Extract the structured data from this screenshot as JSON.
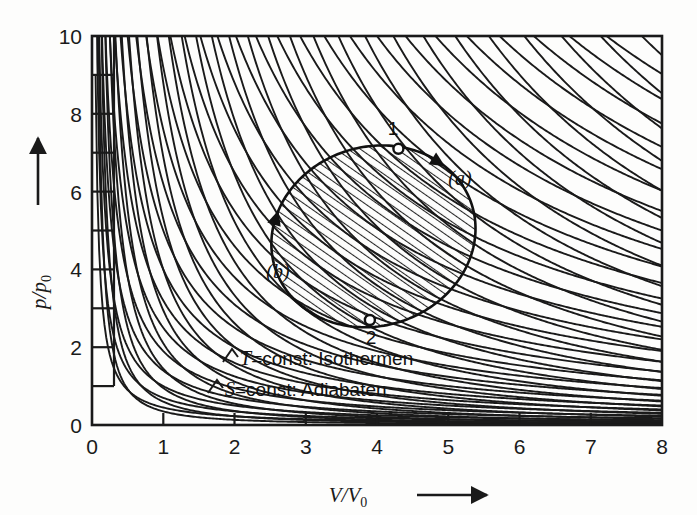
{
  "figure": {
    "name": "p-V diagram with isotherms and adiabats",
    "background_color": "#fdfdfc",
    "ink_color": "#1a1a1a"
  },
  "chart_data": {
    "type": "line",
    "title": "",
    "xlabel": "V/V0",
    "ylabel": "p/p0",
    "xlabel_display": "V/V",
    "xlabel_sub": "0",
    "ylabel_display": "p/p",
    "ylabel_sub": "0",
    "xlim": [
      0,
      8
    ],
    "ylim": [
      0,
      10
    ],
    "grid": false,
    "x_ticks_major": [
      0,
      1,
      2,
      3,
      4,
      5,
      6,
      7,
      8
    ],
    "x_tick_labels": [
      "0",
      "1",
      "2",
      "3",
      "4",
      "5",
      "6",
      "7",
      "8"
    ],
    "y_ticks_major": [
      0,
      2,
      4,
      6,
      8,
      10
    ],
    "y_tick_labels": [
      "0",
      "2",
      "4",
      "6",
      "8",
      "10"
    ],
    "y_ticks_minor": [
      1,
      3,
      5,
      7,
      9
    ],
    "x_arrow": true,
    "y_arrow": true,
    "series": [
      {
        "name": "Isothermen",
        "family": "isotherm",
        "law": "p*V = c",
        "exponent": 1.0,
        "legend_label": "T=const: Isothermen",
        "legend_symbol": "T",
        "legend_rest": "=const: Isothermen",
        "constants": [
          0.45,
          0.7,
          1.0,
          1.4,
          1.9,
          2.5,
          3.2,
          4.0,
          5.0,
          6.2,
          7.6,
          9.2,
          11.0,
          13.0,
          15.2,
          17.6,
          20.2,
          23.0,
          26.0,
          29.2,
          32.6,
          36.2,
          40.0,
          44.0,
          48.2,
          52.6,
          57.2,
          62.0,
          67.0,
          72.2
        ]
      },
      {
        "name": "Adiabaten",
        "family": "adiabat",
        "law": "p*V^1.4 = c",
        "exponent": 1.4,
        "legend_label": "S=const: Adiabaten",
        "legend_symbol": "S",
        "legend_rest": "=const: Adiabaten",
        "constants": [
          0.35,
          0.6,
          0.95,
          1.45,
          2.1,
          2.95,
          4.0,
          5.3,
          6.9,
          8.8,
          11.1,
          13.8,
          17.0,
          20.7,
          25.0,
          29.9,
          35.5,
          41.8,
          48.9,
          56.8,
          65.6,
          75.3,
          86.0,
          97.8,
          110.7,
          124.8,
          140.1,
          156.7,
          174.7,
          194.1
        ]
      }
    ],
    "cycle": {
      "name": "closed thermodynamic cycle",
      "shape": "oval",
      "center": [
        3.95,
        4.85
      ],
      "radius_x": 1.45,
      "radius_y": 2.3,
      "rotation_deg": -18,
      "hatched": true,
      "states": [
        {
          "label": "1",
          "x": 4.3,
          "y": 7.1
        },
        {
          "label": "2",
          "x": 3.9,
          "y": 2.7
        }
      ],
      "branches": [
        {
          "label": "(a)",
          "label_x": 5.25,
          "label_y": 6.35,
          "direction": "clockwise-right-descending"
        },
        {
          "label": "(b)",
          "label_x": 2.6,
          "label_y": 3.95,
          "direction": "clockwise-left-ascending"
        }
      ]
    },
    "annotations": [
      {
        "text": "T=const: Isothermen",
        "x": 2.05,
        "y": 1.55
      },
      {
        "text": "S=const: Adiabaten",
        "x": 1.85,
        "y": 0.78
      },
      {
        "text": "1",
        "x": 4.3,
        "y": 7.55
      },
      {
        "text": "2",
        "x": 3.92,
        "y": 2.2
      },
      {
        "text": "(a)",
        "x": 5.25,
        "y": 6.35
      },
      {
        "text": "(b)",
        "x": 2.6,
        "y": 3.95
      }
    ]
  }
}
